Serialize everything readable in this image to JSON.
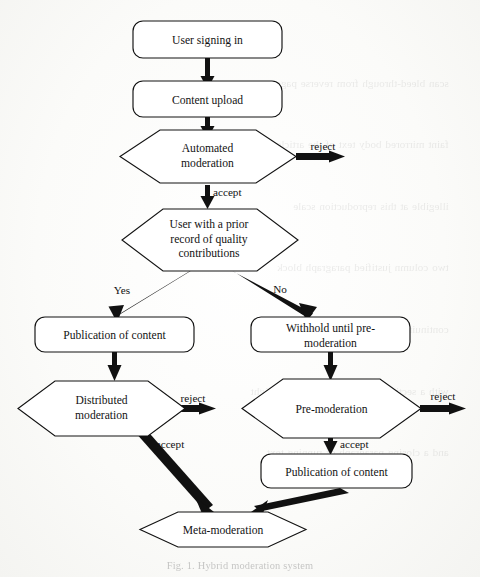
{
  "figure": {
    "caption": "Fig. 1. Hybrid moderation system",
    "ink_color": "#121212",
    "paper_color": "#fdfdfc",
    "shape_fill": "#ffffff"
  },
  "nodes": {
    "user_signing_in": {
      "label": "User signing in",
      "shape": "rounded-rect"
    },
    "content_upload": {
      "label": "Content upload",
      "shape": "rounded-rect"
    },
    "automated_moderation": {
      "label_line1": "Automated",
      "label_line2": "moderation",
      "shape": "hexagon"
    },
    "prior_record": {
      "label_line1": "User with a prior",
      "label_line2": "record of quality",
      "label_line3": "contributions",
      "shape": "hexagon"
    },
    "publication_left": {
      "label": "Publication of content",
      "shape": "rounded-rect"
    },
    "withhold": {
      "label_line1": "Withhold until pre-",
      "label_line2": "moderation",
      "shape": "rounded-rect"
    },
    "distributed_moderation": {
      "label_line1": "Distributed",
      "label_line2": "moderation",
      "shape": "hexagon"
    },
    "pre_moderation": {
      "label": "Pre-moderation",
      "shape": "hexagon"
    },
    "publication_right": {
      "label": "Publication of content",
      "shape": "rounded-rect"
    },
    "meta_moderation": {
      "label": "Meta-moderation",
      "shape": "hexagon"
    }
  },
  "edge_labels": {
    "reject_automated": "reject",
    "accept_automated": "accept",
    "yes_branch": "Yes",
    "no_branch": "No",
    "reject_distributed": "reject",
    "accept_distributed": "accept",
    "reject_premoderation": "reject",
    "accept_premoderation": "accept"
  },
  "background_bleed": {
    "line01": "scan bleed-through from reverse page",
    "line02": "faint mirrored body text of the article",
    "line03": "illegible at this reproduction scale",
    "line04": "two column justified paragraph block",
    "line05": "continuing beneath the flowchart figure",
    "line06": "with a section heading near the lower right",
    "line07": "and a closing paragraph of running text"
  }
}
